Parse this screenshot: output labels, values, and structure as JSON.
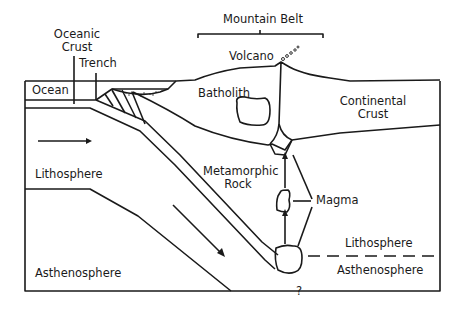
{
  "diagram": {
    "type": "subduction-zone cross-section",
    "labels": {
      "mountain_belt": "Mountain Belt",
      "oceanic_crust_1": "Oceanic",
      "oceanic_crust_2": "Crust",
      "trench": "Trench",
      "volcano": "Volcano",
      "ocean": "Ocean",
      "batholith": "Batholith",
      "continental_crust_1": "Continental",
      "continental_crust_2": "Crust",
      "lithosphere_left": "Lithosphere",
      "metamorphic_rock_1": "Metamorphic",
      "metamorphic_rock_2": "Rock",
      "magma": "Magma",
      "lithosphere_right": "Lithosphere",
      "asthenosphere_left": "Asthenosphere",
      "asthenosphere_right": "Asthenosphere",
      "unknown": "?"
    },
    "colors": {
      "line": "#1a1a1a",
      "background": "#ffffff"
    }
  }
}
